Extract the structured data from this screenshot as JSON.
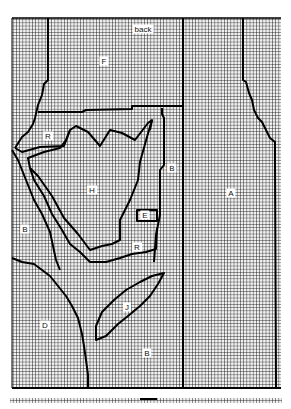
{
  "diagram": {
    "type": "knitting-chart",
    "grid": {
      "cell_px": 3.2,
      "line_color": "#1a1a1a",
      "background": "#e9e9e9"
    },
    "outline_color": "#000000",
    "labels": [
      {
        "id": "back",
        "text": "back",
        "x": 143,
        "y": 29
      },
      {
        "id": "F",
        "text": "F",
        "x": 104,
        "y": 61
      },
      {
        "id": "R1",
        "text": "R",
        "x": 48,
        "y": 136
      },
      {
        "id": "H",
        "text": "H",
        "x": 92,
        "y": 190
      },
      {
        "id": "B1",
        "text": "B",
        "x": 172,
        "y": 168
      },
      {
        "id": "A",
        "text": "A",
        "x": 231,
        "y": 193
      },
      {
        "id": "E",
        "text": "E",
        "x": 145,
        "y": 215
      },
      {
        "id": "B2",
        "text": "B",
        "x": 25,
        "y": 229
      },
      {
        "id": "R2",
        "text": "R",
        "x": 137,
        "y": 247
      },
      {
        "id": "J",
        "text": "J",
        "x": 127,
        "y": 307
      },
      {
        "id": "D",
        "text": "D",
        "x": 45,
        "y": 325
      },
      {
        "id": "B3",
        "text": "B",
        "x": 147,
        "y": 353
      }
    ]
  }
}
